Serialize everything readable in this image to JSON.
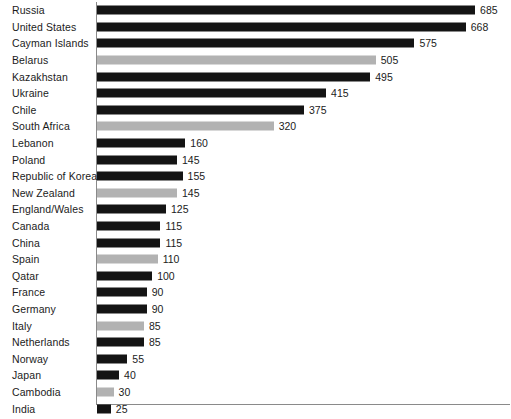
{
  "chart_data": {
    "type": "bar",
    "orientation": "horizontal",
    "title": "",
    "subtitle": "",
    "xlabel": "",
    "ylabel": "",
    "xlim": [
      0,
      740
    ],
    "grid": false,
    "legend": null,
    "value_labels_shown": true,
    "categories": [
      "Russia",
      "United States",
      "Cayman Islands",
      "Belarus",
      "Kazakhstan",
      "Ukraine",
      "Chile",
      "South Africa",
      "Lebanon",
      "Poland",
      "Republic of Korea",
      "New Zealand",
      "England/Wales",
      "Canada",
      "China",
      "Spain",
      "Qatar",
      "France",
      "Germany",
      "Italy",
      "Netherlands",
      "Norway",
      "Japan",
      "Cambodia",
      "India"
    ],
    "values": [
      685,
      668,
      575,
      505,
      495,
      415,
      375,
      320,
      160,
      145,
      155,
      145,
      125,
      115,
      115,
      110,
      100,
      90,
      90,
      85,
      85,
      55,
      40,
      30,
      25
    ],
    "value_label_text": [
      "685",
      "668",
      "575",
      "505",
      "495",
      "415",
      "375",
      "320",
      "160",
      "145",
      "155",
      "145",
      "125",
      "115",
      "115",
      "110",
      "100",
      "90",
      "90",
      "85",
      "85",
      "55",
      "40",
      "30",
      "25"
    ],
    "bar_shades": [
      "dark",
      "dark",
      "dark",
      "light",
      "dark",
      "dark",
      "dark",
      "light",
      "dark",
      "dark",
      "dark",
      "light",
      "dark",
      "dark",
      "dark",
      "light",
      "dark",
      "dark",
      "dark",
      "light",
      "dark",
      "dark",
      "dark",
      "light",
      "dark"
    ],
    "colors": {
      "dark": "#141414",
      "light": "#b2b2b2",
      "axis": "#8a8a8a",
      "text": "#1b1b1b",
      "background": "#ffffff"
    },
    "pixels_per_unit": 0.552
  }
}
